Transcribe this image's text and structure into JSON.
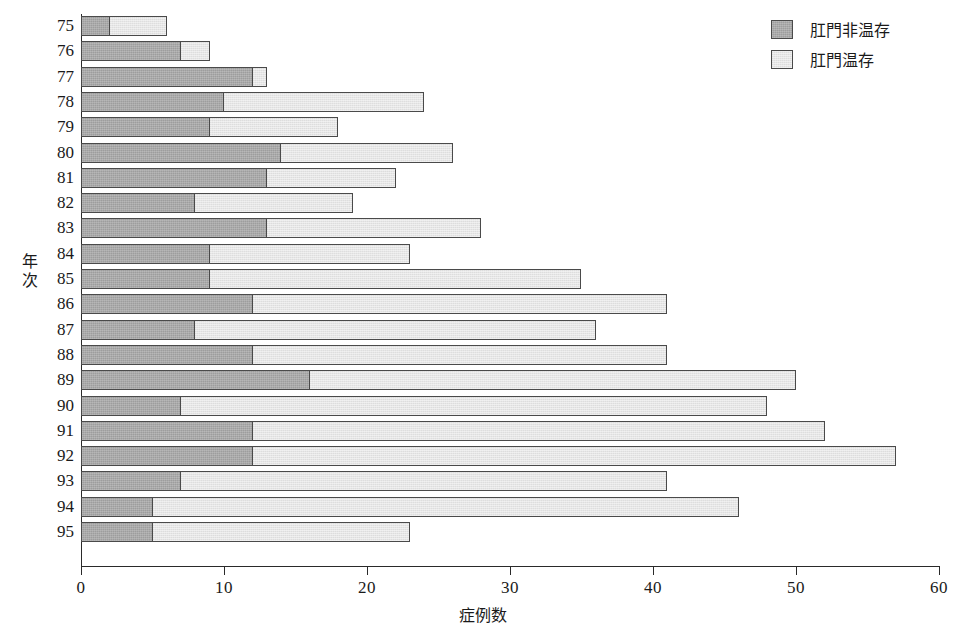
{
  "chart_data": {
    "type": "bar",
    "orientation": "horizontal",
    "stacked": true,
    "title": "",
    "xlabel": "症例数",
    "ylabel": "年次",
    "xlim": [
      0,
      60
    ],
    "xticks": [
      0,
      10,
      20,
      30,
      40,
      50,
      60
    ],
    "xtick_labels": [
      "0",
      "10",
      "20",
      "30",
      "40",
      "50",
      "60"
    ],
    "grid": false,
    "legend_position": "top-right",
    "categories": [
      "75",
      "76",
      "77",
      "78",
      "79",
      "80",
      "81",
      "82",
      "83",
      "84",
      "85",
      "86",
      "87",
      "88",
      "89",
      "90",
      "91",
      "92",
      "93",
      "94",
      "95"
    ],
    "series": [
      {
        "name": "肛門非温存",
        "color": "#9d9d9d",
        "values": [
          2,
          7,
          12,
          10,
          9,
          14,
          13,
          8,
          13,
          9,
          9,
          12,
          8,
          12,
          16,
          7,
          12,
          12,
          7,
          5,
          5
        ]
      },
      {
        "name": "肛門温存",
        "color": "#e6e6e6",
        "values": [
          4,
          2,
          1,
          14,
          9,
          12,
          9,
          11,
          15,
          14,
          26,
          29,
          28,
          29,
          34,
          41,
          40,
          45,
          34,
          41,
          18
        ]
      }
    ],
    "totals": [
      6,
      9,
      13,
      24,
      18,
      26,
      22,
      19,
      28,
      23,
      35,
      41,
      36,
      41,
      50,
      48,
      52,
      57,
      41,
      46,
      23
    ]
  },
  "legend": {
    "items": [
      {
        "label": "肛門非温存",
        "swatch": "dark"
      },
      {
        "label": "肛門温存",
        "swatch": "light"
      }
    ]
  },
  "axes": {
    "x_title": "症例数",
    "y_title_chars": [
      "年",
      "次"
    ]
  },
  "colors": {
    "dark_fill": "#9d9d9d",
    "light_fill": "#e6e6e6",
    "outline": "#4a4a4a",
    "axis": "#2a2a2a",
    "background": "#ffffff"
  }
}
